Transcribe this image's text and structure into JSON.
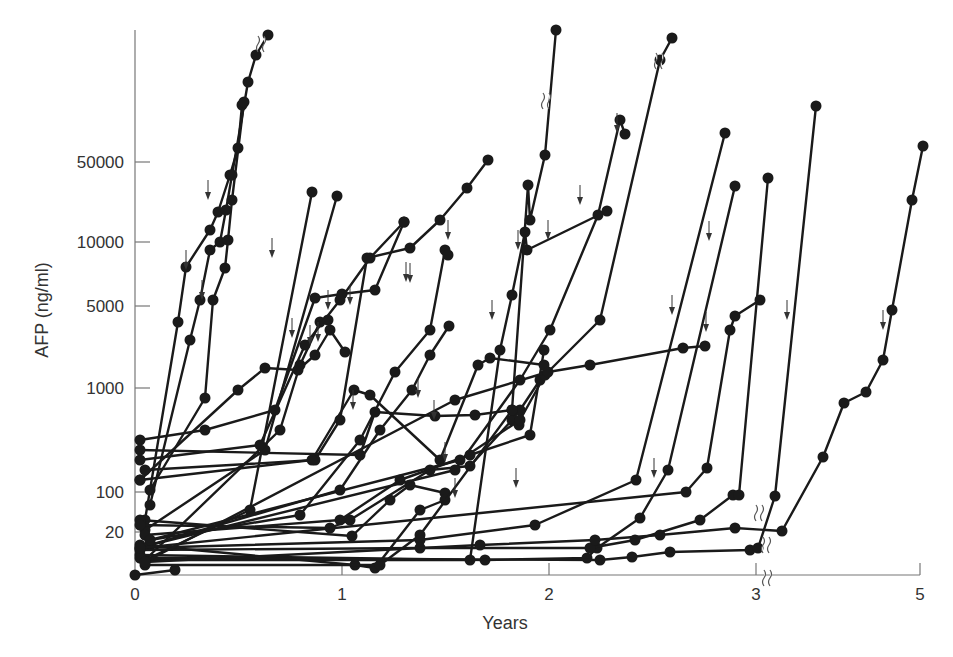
{
  "chart_data": {
    "type": "line",
    "title": "",
    "xlabel": "Years",
    "ylabel": "AFP (ng/ml)",
    "x_ticks": [
      {
        "label": "0",
        "px": 135
      },
      {
        "label": "1",
        "px": 342
      },
      {
        "label": "2",
        "px": 549
      },
      {
        "label": "3",
        "px": 756
      },
      {
        "label": "5",
        "px": 920
      }
    ],
    "y_ticks": [
      {
        "label": "50000",
        "py": 162
      },
      {
        "label": "10000",
        "py": 242
      },
      {
        "label": "5000",
        "py": 306
      },
      {
        "label": "1000",
        "py": 388
      },
      {
        "label": "100",
        "py": 492
      },
      {
        "label": "20",
        "py": 532
      }
    ],
    "y_scale": "log (non-uniform, broken)",
    "x_axis_break_after": 3,
    "grid": false,
    "legend": null,
    "markers": "filled circles",
    "annotations": "down arrows mark time of detection; wavy break marks on some series",
    "series_pixel_coords": [
      [
        [
          135,
          575
        ],
        [
          175,
          570
        ]
      ],
      [
        [
          145,
          520
        ],
        [
          178,
          322
        ],
        [
          186,
          267
        ],
        [
          210,
          230
        ],
        [
          218,
          212
        ],
        [
          230,
          175
        ],
        [
          238,
          148
        ],
        [
          242,
          105
        ]
      ],
      [
        [
          150,
          505
        ],
        [
          190,
          340
        ],
        [
          200,
          300
        ],
        [
          210,
          250
        ],
        [
          220,
          242
        ],
        [
          226,
          210
        ],
        [
          232,
          175
        ],
        [
          248,
          82
        ],
        [
          256,
          55
        ],
        [
          268,
          35
        ]
      ],
      [
        [
          150,
          490
        ],
        [
          205,
          398
        ],
        [
          213,
          300
        ],
        [
          225,
          268
        ],
        [
          228,
          240
        ],
        [
          232,
          200
        ],
        [
          244,
          102
        ]
      ],
      [
        [
          145,
          560
        ],
        [
          250,
          510
        ],
        [
          312,
          192
        ]
      ],
      [
        [
          145,
          530
        ],
        [
          265,
          450
        ],
        [
          337,
          196
        ]
      ],
      [
        [
          140,
          480
        ],
        [
          238,
          390
        ],
        [
          265,
          368
        ],
        [
          298,
          370
        ],
        [
          315,
          355
        ],
        [
          330,
          330
        ],
        [
          345,
          352
        ]
      ],
      [
        [
          145,
          560
        ],
        [
          280,
          430
        ],
        [
          300,
          365
        ],
        [
          320,
          322
        ],
        [
          328,
          320
        ]
      ],
      [
        [
          140,
          440
        ],
        [
          205,
          430
        ],
        [
          275,
          410
        ],
        [
          315,
          298
        ],
        [
          342,
          294
        ],
        [
          375,
          290
        ],
        [
          404,
          222
        ]
      ],
      [
        [
          140,
          460
        ],
        [
          260,
          445
        ],
        [
          305,
          345
        ],
        [
          340,
          300
        ],
        [
          370,
          258
        ],
        [
          404,
          222
        ]
      ],
      [
        [
          145,
          470
        ],
        [
          315,
          460
        ],
        [
          340,
          420
        ],
        [
          367,
          258
        ],
        [
          410,
          248
        ],
        [
          440,
          220
        ],
        [
          467,
          188
        ],
        [
          488,
          160
        ]
      ],
      [
        [
          150,
          540
        ],
        [
          300,
          515
        ],
        [
          360,
          440
        ],
        [
          395,
          372
        ],
        [
          430,
          330
        ],
        [
          445,
          250
        ],
        [
          448,
          255
        ]
      ],
      [
        [
          150,
          545
        ],
        [
          340,
          490
        ],
        [
          380,
          430
        ],
        [
          412,
          390
        ],
        [
          430,
          355
        ],
        [
          449,
          326
        ]
      ],
      [
        [
          140,
          520
        ],
        [
          352,
          536
        ],
        [
          390,
          500
        ],
        [
          410,
          485
        ],
        [
          445,
          493
        ]
      ],
      [
        [
          140,
          545
        ],
        [
          355,
          565
        ],
        [
          375,
          568
        ],
        [
          420,
          510
        ],
        [
          445,
          500
        ]
      ],
      [
        [
          140,
          525
        ],
        [
          330,
          528
        ],
        [
          350,
          520
        ],
        [
          430,
          470
        ],
        [
          470,
          466
        ],
        [
          512,
          420
        ],
        [
          520,
          410
        ],
        [
          540,
          380
        ]
      ],
      [
        [
          140,
          450
        ],
        [
          360,
          455
        ],
        [
          375,
          412
        ],
        [
          435,
          416
        ],
        [
          475,
          415
        ],
        [
          512,
          410
        ],
        [
          519,
          425
        ]
      ],
      [
        [
          145,
          535
        ],
        [
          340,
          520
        ],
        [
          400,
          480
        ],
        [
          470,
          455
        ],
        [
          530,
          435
        ],
        [
          544,
          350
        ]
      ],
      [
        [
          140,
          480
        ],
        [
          312,
          460
        ],
        [
          354,
          390
        ],
        [
          370,
          395
        ],
        [
          440,
          460
        ],
        [
          478,
          365
        ],
        [
          490,
          358
        ],
        [
          544,
          365
        ]
      ],
      [
        [
          145,
          565
        ],
        [
          380,
          565
        ],
        [
          420,
          535
        ],
        [
          512,
          410
        ],
        [
          528,
          185
        ],
        [
          530,
          220
        ],
        [
          545,
          155
        ],
        [
          556,
          30
        ]
      ],
      [
        [
          145,
          560
        ],
        [
          470,
          560
        ],
        [
          500,
          350
        ],
        [
          512,
          295
        ],
        [
          525,
          232
        ],
        [
          527,
          250
        ],
        [
          607,
          211
        ]
      ],
      [
        [
          150,
          545
        ],
        [
          455,
          470
        ],
        [
          520,
          380
        ],
        [
          550,
          330
        ],
        [
          598,
          215
        ],
        [
          620,
          120
        ],
        [
          625,
          134
        ]
      ],
      [
        [
          150,
          540
        ],
        [
          460,
          460
        ],
        [
          520,
          420
        ],
        [
          545,
          375
        ],
        [
          600,
          320
        ],
        [
          660,
          60
        ],
        [
          672,
          38
        ]
      ],
      [
        [
          140,
          548
        ],
        [
          420,
          540
        ],
        [
          535,
          525
        ],
        [
          636,
          480
        ],
        [
          725,
          133
        ]
      ],
      [
        [
          140,
          555
        ],
        [
          485,
          560
        ],
        [
          587,
          558
        ],
        [
          597,
          548
        ],
        [
          640,
          518
        ],
        [
          668,
          470
        ],
        [
          735,
          186
        ]
      ],
      [
        [
          140,
          550
        ],
        [
          420,
          548
        ],
        [
          590,
          548
        ],
        [
          635,
          540
        ],
        [
          700,
          520
        ],
        [
          733,
          495
        ],
        [
          739,
          495
        ],
        [
          768,
          178
        ]
      ],
      [
        [
          140,
          558
        ],
        [
          600,
          560
        ],
        [
          632,
          557
        ],
        [
          670,
          552
        ],
        [
          750,
          550
        ],
        [
          758,
          548
        ],
        [
          775,
          496
        ],
        [
          816,
          106
        ]
      ],
      [
        [
          140,
          548
        ],
        [
          686,
          492
        ],
        [
          707,
          468
        ],
        [
          730,
          330
        ],
        [
          735,
          316
        ],
        [
          760,
          300
        ]
      ],
      [
        [
          145,
          562
        ],
        [
          480,
          545
        ],
        [
          595,
          540
        ],
        [
          660,
          535
        ],
        [
          735,
          528
        ],
        [
          782,
          531
        ],
        [
          823,
          457
        ],
        [
          844,
          403
        ],
        [
          866,
          392
        ],
        [
          883,
          360
        ],
        [
          892,
          310
        ],
        [
          912,
          200
        ],
        [
          923,
          146
        ]
      ],
      [
        [
          145,
          562
        ],
        [
          455,
          400
        ],
        [
          548,
          372
        ],
        [
          590,
          365
        ],
        [
          683,
          348
        ],
        [
          705,
          346
        ]
      ]
    ],
    "down_arrows_px": [
      [
        186,
        270
      ],
      [
        208,
        200
      ],
      [
        202,
        300
      ],
      [
        272,
        258
      ],
      [
        292,
        338
      ],
      [
        310,
        345
      ],
      [
        318,
        342
      ],
      [
        328,
        310
      ],
      [
        350,
        305
      ],
      [
        406,
        282
      ],
      [
        410,
        283
      ],
      [
        418,
        398
      ],
      [
        353,
        410
      ],
      [
        448,
        240
      ],
      [
        492,
        320
      ],
      [
        434,
        420
      ],
      [
        445,
        462
      ],
      [
        455,
        498
      ],
      [
        518,
        250
      ],
      [
        516,
        488
      ],
      [
        548,
        240
      ],
      [
        580,
        205
      ],
      [
        617,
        133
      ],
      [
        672,
        315
      ],
      [
        706,
        332
      ],
      [
        709,
        241
      ],
      [
        654,
        478
      ],
      [
        787,
        320
      ],
      [
        883,
        330
      ]
    ],
    "break_marks_px": [
      [
        262,
        44
      ],
      [
        547,
        101
      ],
      [
        660,
        61
      ],
      [
        760,
        513
      ],
      [
        767,
        545
      ],
      [
        768,
        578
      ]
    ]
  }
}
